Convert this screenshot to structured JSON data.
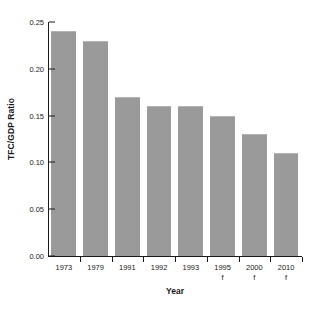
{
  "chart_data": {
    "type": "bar",
    "title": "",
    "xlabel": "Year",
    "ylabel": "TFC/GDP Ratio",
    "categories": [
      "1973",
      "1979",
      "1991",
      "1992",
      "1993",
      "1995",
      "2000",
      "2010"
    ],
    "category_suffixes": [
      "",
      "",
      "",
      "",
      "",
      "f",
      "f",
      "f"
    ],
    "values": [
      0.24,
      0.23,
      0.17,
      0.16,
      0.16,
      0.15,
      0.13,
      0.11
    ],
    "ylim": [
      0.0,
      0.25
    ],
    "ytick_labels": [
      "0.00",
      "0.05",
      "0.10",
      "0.15",
      "0.20",
      "0.25"
    ],
    "ytick_values": [
      0.0,
      0.05,
      0.1,
      0.15,
      0.2,
      0.25
    ],
    "grid": false,
    "legend": false,
    "bar_color": "#9a9a9a",
    "bar_edge_color": "#b4b4b4",
    "axis_color": "#1a1a1a",
    "background_color": "#ffffff"
  },
  "axes": {
    "y_title": "TFC/GDP Ratio",
    "x_title": "Year"
  }
}
